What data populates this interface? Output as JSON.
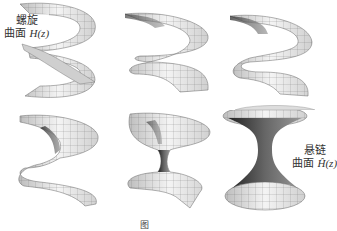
{
  "figure": {
    "panels": [
      {
        "id": 1,
        "label_line1": "螺旋",
        "label_line2": "曲面",
        "label_math": "H(z)"
      },
      {
        "id": 2
      },
      {
        "id": 3
      },
      {
        "id": 4
      },
      {
        "id": 5
      },
      {
        "id": 6,
        "label_line1": "悬链",
        "label_line2": "曲面",
        "label_math": "Ĥ(z)"
      }
    ],
    "caption": "图"
  },
  "colors": {
    "mesh": "#555555",
    "fill_light": "#f2f2f2",
    "fill_dark": "#2a2a2a"
  }
}
